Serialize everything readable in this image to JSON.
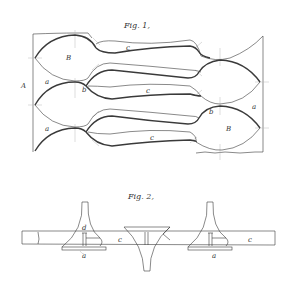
{
  "figure1": {
    "title": "Fig. 1,",
    "labels": {
      "A": "A",
      "B_top": "B",
      "B_bottom": "B",
      "a_left_1": "a",
      "a_left_2": "a",
      "a_right": "a",
      "b_left": "b",
      "b_right": "b",
      "c_1": "c",
      "c_2": "c",
      "c_3": "c"
    }
  },
  "figure2": {
    "title": "Fig. 2,",
    "labels": {
      "d": "d",
      "c_left": "c",
      "c_right": "c",
      "a_left": "a",
      "a_right": "a"
    }
  },
  "colors": {
    "ink": "#3a3a3a",
    "paper": "#ffffff",
    "construction": "#b8b8b8"
  }
}
